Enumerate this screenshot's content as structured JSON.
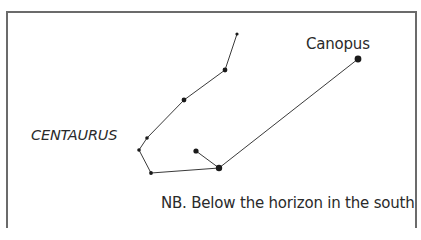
{
  "diagram": {
    "constellation_label": "CENTAURUS",
    "star_label": "Canopus",
    "note": "NB. Below the horizon in the south",
    "line_color": "#3a3a3a",
    "star_color": "#1a1a1a",
    "frame_color": "#6b6b6b",
    "stars": [
      {
        "id": "s1",
        "x": 237,
        "y": 34,
        "r": 1.6
      },
      {
        "id": "s2",
        "x": 225,
        "y": 70,
        "r": 2.4
      },
      {
        "id": "s3",
        "x": 184,
        "y": 100,
        "r": 2.4
      },
      {
        "id": "s4",
        "x": 147,
        "y": 138,
        "r": 1.8
      },
      {
        "id": "s5",
        "x": 139,
        "y": 150,
        "r": 1.8
      },
      {
        "id": "s6",
        "x": 151,
        "y": 173,
        "r": 1.9
      },
      {
        "id": "s7",
        "x": 219,
        "y": 168,
        "r": 3.2
      },
      {
        "id": "s8",
        "x": 196,
        "y": 151,
        "r": 2.6
      },
      {
        "id": "canopus",
        "x": 358,
        "y": 59,
        "r": 3.4
      }
    ],
    "edges": [
      [
        "s1",
        "s2"
      ],
      [
        "s2",
        "s3"
      ],
      [
        "s3",
        "s4"
      ],
      [
        "s4",
        "s5"
      ],
      [
        "s5",
        "s6"
      ],
      [
        "s6",
        "s7"
      ],
      [
        "s7",
        "s8"
      ],
      [
        "s7",
        "canopus"
      ]
    ]
  }
}
